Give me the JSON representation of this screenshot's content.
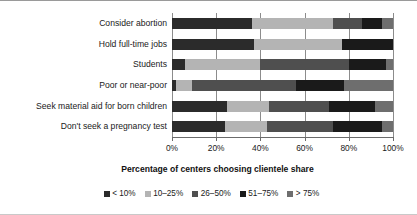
{
  "chart_data": {
    "type": "bar",
    "orientation": "horizontal",
    "stacked": true,
    "normalized_percent": true,
    "title": "",
    "xlabel": "Percentage of centers choosing clientele share",
    "ylabel": "",
    "xlim": [
      0,
      100
    ],
    "xticks": [
      "0%",
      "20%",
      "40%",
      "60%",
      "80%",
      "100%"
    ],
    "xtick_values": [
      0,
      20,
      40,
      60,
      80,
      100
    ],
    "grid": true,
    "legend_position": "bottom",
    "categories": [
      "Consider abortion",
      "Hold full-time jobs",
      "Students",
      "Poor or near-poor",
      "Seek material aid for born children",
      "Don't seek a pregnancy test"
    ],
    "series": [
      {
        "name": "< 10%",
        "color": "#2b2b2b",
        "values": [
          36,
          37,
          6,
          2,
          25,
          24
        ]
      },
      {
        "name": "10–25%",
        "color": "#b4b4b4",
        "values": [
          37,
          40,
          34,
          7,
          19,
          19
        ]
      },
      {
        "name": "26–50%",
        "color": "#4f4f4f",
        "values": [
          13,
          0,
          40,
          47,
          27,
          30
        ]
      },
      {
        "name": "51–75%",
        "color": "#1a1a1a",
        "values": [
          9,
          23,
          17,
          22,
          21,
          22
        ]
      },
      {
        "name": "> 75%",
        "color": "#6e6e6e",
        "values": [
          5,
          0,
          3,
          22,
          8,
          5
        ]
      }
    ]
  }
}
